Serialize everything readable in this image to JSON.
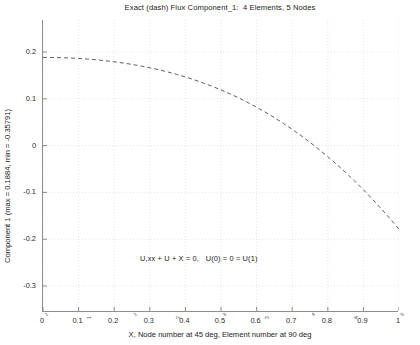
{
  "chart_data": {
    "type": "line",
    "title": "Exact (dash) Flux Component_1:  4 Elements, 5 Nodes",
    "subtitle": "",
    "xlabel": "X, Node number at 45 deg, Element number at 90 deg",
    "ylabel": "Component 1 (max = 0.1884, min = -0.35791)",
    "xlim": [
      0,
      1
    ],
    "ylim": [
      -0.35791,
      0.1884
    ],
    "grid": true,
    "grid_style": "dotted",
    "grid_color": "#d9d9d9",
    "legend": "none",
    "annotations": [
      {
        "text": "U,xx + U + X = 0,   U(0) = 0 = U(1)",
        "x": 0.3,
        "y": -0.25
      }
    ],
    "xticks": [
      0,
      0.1,
      0.2,
      0.3,
      0.4,
      0.5,
      0.6,
      0.7,
      0.8,
      0.9,
      1
    ],
    "xticklabels": [
      "0",
      "0.1",
      "0.2",
      "0.3",
      "0.4",
      "0.5",
      "0.6",
      "0.7",
      "0.8",
      "0.9",
      "1"
    ],
    "yticks": [
      0.2,
      0.1,
      0,
      -0.1,
      -0.2,
      -0.3
    ],
    "yticklabels": [
      "0.2",
      "0.1",
      "0",
      "-0.1",
      "-0.2",
      "-0.3"
    ],
    "series": [
      {
        "name": "Exact (dash) Flux Component_1",
        "style": "dashed",
        "color": "#4d4d4d",
        "x": [
          0,
          0.025,
          0.05,
          0.075,
          0.1,
          0.125,
          0.15,
          0.175,
          0.2,
          0.225,
          0.25,
          0.275,
          0.3,
          0.325,
          0.35,
          0.375,
          0.4,
          0.425,
          0.45,
          0.475,
          0.5,
          0.525,
          0.55,
          0.575,
          0.6,
          0.625,
          0.65,
          0.675,
          0.7,
          0.725,
          0.75,
          0.775,
          0.8,
          0.825,
          0.85,
          0.875,
          0.9,
          0.925,
          0.95,
          0.975,
          1
        ],
        "y": [
          0.1884,
          0.1883,
          0.1879,
          0.1872,
          0.1862,
          0.1849,
          0.1833,
          0.1814,
          0.1791,
          0.1765,
          0.1735,
          0.1701,
          0.1663,
          0.1621,
          0.1574,
          0.1523,
          0.1467,
          0.1406,
          0.134,
          0.1268,
          0.119,
          0.1107,
          0.1018,
          0.0922,
          0.082,
          0.0712,
          0.0597,
          0.0476,
          0.0347,
          0.0212,
          0.007,
          -0.008,
          -0.0237,
          -0.0402,
          -0.0574,
          -0.0755,
          -0.0944,
          -0.1142,
          -0.1348,
          -0.1563,
          -0.1787
        ]
      }
    ],
    "max_value": 0.1884,
    "min_value": -0.35791,
    "element_count": 4,
    "node_count": 5,
    "node_markers": [
      {
        "label": "1",
        "x": 0.0
      },
      {
        "label": "2",
        "x": 0.25
      },
      {
        "label": "3",
        "x": 0.5
      },
      {
        "label": "4",
        "x": 0.75
      },
      {
        "label": "5",
        "x": 1.0
      }
    ],
    "element_markers": [
      {
        "label": "1",
        "x": 0.125
      },
      {
        "label": "2",
        "x": 0.375
      },
      {
        "label": "3",
        "x": 0.625
      },
      {
        "label": "4",
        "x": 0.875
      }
    ]
  }
}
